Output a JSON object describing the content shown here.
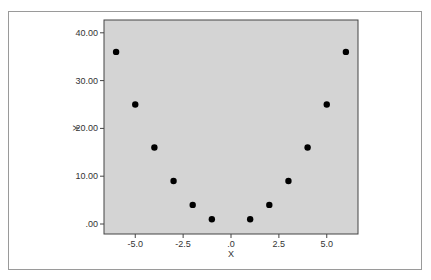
{
  "chart_data": {
    "type": "scatter",
    "title": "",
    "xlabel": "X",
    "ylabel": "Y",
    "xlim": [
      -6.6,
      6.6
    ],
    "ylim": [
      -2.1,
      42.8
    ],
    "grid": false,
    "legend": null,
    "x_ticks": [
      -5.0,
      -2.5,
      0.0,
      2.5,
      5.0
    ],
    "x_tick_labels": [
      "-5.0",
      "-2.5",
      ".0",
      "2.5",
      "5.0"
    ],
    "y_ticks": [
      0,
      10,
      20,
      30,
      40
    ],
    "y_tick_labels": [
      ".00",
      "10.00",
      "20.00",
      "30.00",
      "40.00"
    ],
    "series": [
      {
        "name": "Y",
        "marker": "circle",
        "color": "#000000",
        "points": [
          {
            "x": -6,
            "y": 36
          },
          {
            "x": -5,
            "y": 25
          },
          {
            "x": -4,
            "y": 16
          },
          {
            "x": -3,
            "y": 9
          },
          {
            "x": -2,
            "y": 4
          },
          {
            "x": -1,
            "y": 1
          },
          {
            "x": 1,
            "y": 1
          },
          {
            "x": 2,
            "y": 4
          },
          {
            "x": 3,
            "y": 9
          },
          {
            "x": 4,
            "y": 16
          },
          {
            "x": 5,
            "y": 25
          },
          {
            "x": 6,
            "y": 36
          }
        ]
      }
    ]
  },
  "style": {
    "plot_background": "#d4d4d4",
    "plot_border": "#444444",
    "frame_border": "#9a9a9a",
    "marker_color": "#000000"
  }
}
